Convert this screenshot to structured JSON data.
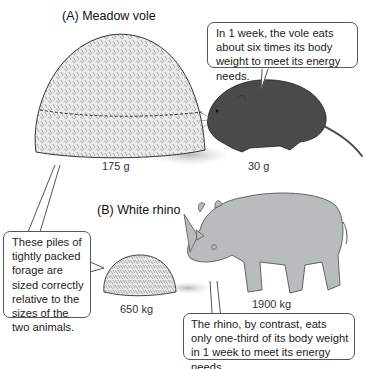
{
  "panels": [
    {
      "title": "(A)  Meadow vole",
      "forage_weight": "175 g",
      "animal_weight": "30 g",
      "callout": "In 1 week, the vole eats about six times its body weight to meet its energy needs."
    },
    {
      "title": "(B)  White rhino",
      "forage_weight": "650 kg",
      "animal_weight": "1900 kg",
      "callout": "The rhino, by contrast, eats only one-third of its body weight in 1 week to meet its energy needs."
    }
  ],
  "shared_callout": "These piles of tightly packed forage are sized correctly relative to the sizes of the two animals.",
  "colors": {
    "vole": "#4a4a4a",
    "rhino": "#b9bcbd",
    "forage": "#e6e6e6",
    "outline": "#555555"
  }
}
